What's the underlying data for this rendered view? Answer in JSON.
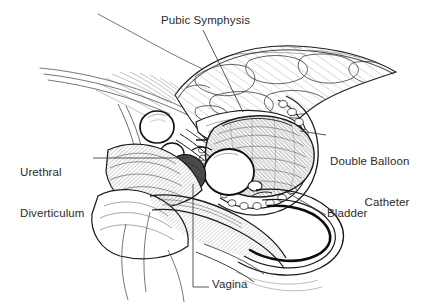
{
  "figure": {
    "type": "medical-line-illustration",
    "background_color": "#ffffff",
    "ink_color": "#1a1a1a",
    "label_color": "#2b2b2b"
  },
  "labels": [
    {
      "id": "pubic-symphysis",
      "text": "Pubic Symphysis",
      "lines": [
        "Pubic Symphysis"
      ],
      "align": "left",
      "leader": "diagonal-down-right"
    },
    {
      "id": "urethral-diverticulum",
      "text": "Urethral Diverticulum",
      "lines": [
        "Urethral",
        "Diverticulum"
      ],
      "align": "left",
      "leader": "horizontal-right"
    },
    {
      "id": "double-balloon-catheter",
      "text": "Double Balloon Catheter",
      "lines": [
        "Double Balloon",
        "Catheter"
      ],
      "align": "right",
      "leader": "horizontal-left"
    },
    {
      "id": "bladder",
      "text": "Bladder",
      "lines": [
        "Bladder"
      ],
      "align": "left",
      "leader": "diagonal-up-left"
    },
    {
      "id": "vagina",
      "text": "Vagina",
      "lines": [
        "Vagina"
      ],
      "align": "left",
      "leader": "elbow-up"
    }
  ],
  "structures": [
    {
      "name": "abdominal-wall",
      "description": "thin sweeping contour lines upper left"
    },
    {
      "name": "pubic-bone",
      "description": "cross-hatched trabecular bone mass, upper center-right"
    },
    {
      "name": "bladder-cavity",
      "description": "hatched sac lower right of pubic bone"
    },
    {
      "name": "proximal-balloon",
      "description": "white oval, left of urethra"
    },
    {
      "name": "distal-balloon",
      "description": "white oval inside bladder neck"
    },
    {
      "name": "catheter-tube",
      "description": "looping tube exiting to lower right"
    },
    {
      "name": "urethral-diverticulum-pouch",
      "description": "dark shaded pouch below urethra"
    },
    {
      "name": "vaginal-canal",
      "description": "curved channel lower center"
    }
  ]
}
